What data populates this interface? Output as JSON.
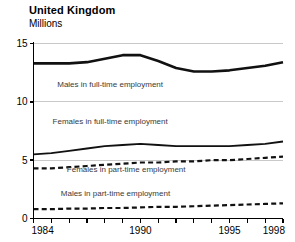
{
  "header": {
    "title": "United Kingdom",
    "subtitle": "Millions"
  },
  "chart_data": {
    "type": "line",
    "title": "United Kingdom",
    "subtitle": "Millions",
    "xlabel": "",
    "ylabel": "Millions",
    "xlim": [
      1984,
      1998
    ],
    "ylim": [
      0,
      15
    ],
    "yticks": [
      0,
      5,
      10,
      15
    ],
    "ytick_labels": [
      "0",
      "5",
      "10",
      "15"
    ],
    "xticks": [
      1984,
      1985,
      1986,
      1987,
      1988,
      1989,
      1990,
      1991,
      1992,
      1993,
      1994,
      1995,
      1996,
      1997,
      1998
    ],
    "xtick_labels_shown": [
      "1984",
      "1990",
      "1995",
      "1998"
    ],
    "grid": "horizontal",
    "legend": "inline-annotations",
    "x": [
      1984,
      1985,
      1986,
      1987,
      1988,
      1989,
      1990,
      1991,
      1992,
      1993,
      1994,
      1995,
      1996,
      1997,
      1998
    ],
    "series": [
      {
        "name": "Males in full-time employment",
        "style": "solid",
        "width": 2.6,
        "color": "#111111",
        "values": [
          13.3,
          13.3,
          13.3,
          13.4,
          13.7,
          14.0,
          14.0,
          13.5,
          12.9,
          12.6,
          12.6,
          12.7,
          12.9,
          13.1,
          13.4
        ]
      },
      {
        "name": "Females in full-time employment",
        "style": "solid",
        "width": 1.8,
        "color": "#111111",
        "values": [
          5.5,
          5.6,
          5.8,
          6.0,
          6.2,
          6.3,
          6.4,
          6.3,
          6.2,
          6.2,
          6.2,
          6.2,
          6.3,
          6.4,
          6.6
        ]
      },
      {
        "name": "Females in part-time employment",
        "style": "dashed",
        "width": 2.2,
        "color": "#111111",
        "values": [
          4.3,
          4.3,
          4.4,
          4.5,
          4.6,
          4.7,
          4.8,
          4.8,
          4.9,
          4.9,
          5.0,
          5.0,
          5.1,
          5.2,
          5.3
        ]
      },
      {
        "name": "Males in part-time employment",
        "style": "dashed",
        "width": 2.2,
        "color": "#111111",
        "values": [
          0.8,
          0.8,
          0.85,
          0.85,
          0.9,
          0.9,
          0.95,
          1.0,
          1.0,
          1.05,
          1.1,
          1.15,
          1.2,
          1.25,
          1.3
        ]
      }
    ],
    "annotations": [
      {
        "text": "Males in full-time employment",
        "x": 1988.3,
        "y": 11.3
      },
      {
        "text": "Females in full-time employment",
        "x": 1988.3,
        "y": 8.1
      },
      {
        "text": "Females in part-time employment",
        "x": 1989.2,
        "y": 4.0
      },
      {
        "text": "Males in part-time employment",
        "x": 1988.6,
        "y": 1.9
      }
    ]
  },
  "colors": {
    "line": "#111111",
    "gridline": "#c9c9c9",
    "axis": "#000000",
    "annotation": "#3a3a3a",
    "background": "#ffffff"
  }
}
